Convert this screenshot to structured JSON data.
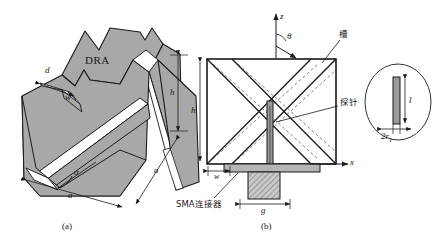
{
  "figure": {
    "title_panels": [
      "(a)",
      "(b)"
    ],
    "panel_a": {
      "caption": "(a)",
      "body_label": "DRA",
      "dimensions": [
        {
          "name": "slot-depth",
          "symbol": "d"
        },
        {
          "name": "slot-width",
          "symbol": "w"
        },
        {
          "name": "height",
          "symbol": "h"
        },
        {
          "name": "side-length-front",
          "symbol": "a"
        },
        {
          "name": "side-length-depth",
          "symbol": "a"
        },
        {
          "name": "apex-angle",
          "symbol": "α"
        }
      ]
    },
    "panel_b": {
      "caption": "(b)",
      "axes": {
        "vertical": "z",
        "horizontal": "x",
        "angle": "θ"
      },
      "annotations": [
        {
          "name": "slot",
          "text": "槽"
        },
        {
          "name": "probe",
          "text": "探针"
        },
        {
          "name": "sma-connector",
          "text": "SMA连接器"
        }
      ],
      "dimensions": [
        {
          "name": "height",
          "symbol": "h"
        },
        {
          "name": "slot-width",
          "symbol": "w"
        },
        {
          "name": "ground-gap",
          "symbol": "g"
        }
      ],
      "inset": {
        "name": "probe-detail",
        "length_symbol": "l",
        "diameter_symbol": "2r",
        "diameter_subscript": "1"
      }
    },
    "colors": {
      "body_fill": "#a8a8a8",
      "body_fill_light": "#bdbdbd",
      "outline": "#1a1a1a",
      "ground_fill": "#b5b5b5",
      "white": "#ffffff",
      "background": "#ffffff"
    }
  }
}
